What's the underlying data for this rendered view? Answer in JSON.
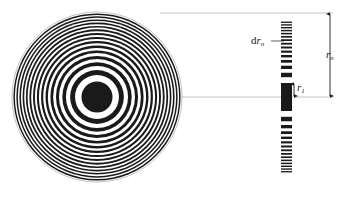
{
  "figure": {
    "background_color": "#ffffff",
    "ink_color": "#1a1a1a",
    "leader_color": "#b4b4b4",
    "width": 343,
    "height": 200
  },
  "zone_plate": {
    "name": "fresnel-zone-plate",
    "center_x": 97,
    "center_y": 97,
    "outer_radius": 85,
    "zone_count": 30,
    "center_is_opaque": true,
    "description": "Concentric alternating opaque and transparent annular zones whose widths decrease with radius"
  },
  "cross_section": {
    "name": "zone-plate-cross-section",
    "x": 281,
    "bar_width": 11,
    "top_y": 13,
    "bottom_y": 186,
    "center_y": 97,
    "innermost_half_height": 14,
    "description": "Vertical strip of opaque bars showing the radial profile of the zone plate"
  },
  "labels": {
    "dr_n": {
      "prefix": "d",
      "symbol": "r",
      "subscript": "n"
    },
    "r_1": {
      "symbol": "r",
      "subscript": "1"
    },
    "r_n": {
      "symbol": "r",
      "subscript": "n"
    }
  },
  "annotations": {
    "dimension_rn": {
      "name": "dimension-arrow-rn",
      "x": 330,
      "from_y": 13,
      "to_y": 97,
      "double_headed": true
    },
    "dimension_r1": {
      "name": "dimension-arrow-r1",
      "x": 294,
      "from_y": 83,
      "to_y": 97,
      "double_headed": true
    },
    "leader_drn": {
      "name": "leader-line-drn",
      "from_x": 271,
      "to_x": 284,
      "y": 41
    },
    "extension_top": {
      "name": "extension-line-top",
      "from_x": 160,
      "to_x": 333,
      "y": 13
    },
    "extension_center": {
      "name": "extension-line-center",
      "from_x": 120,
      "to_x": 333,
      "y": 97
    }
  }
}
